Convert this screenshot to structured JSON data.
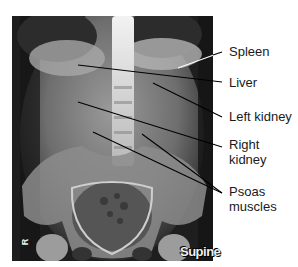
{
  "figure": {
    "type": "labeled abdominal radiograph",
    "view_label": "Supine",
    "side_marker": "R",
    "labels": [
      {
        "id": "spleen",
        "text": "Spleen",
        "x": 229,
        "y": 44,
        "line": [
          [
            178,
            68
          ],
          [
            222,
            52
          ]
        ]
      },
      {
        "id": "liver",
        "text": "Liver",
        "x": 229,
        "y": 75,
        "line": [
          [
            78,
            65
          ],
          [
            222,
            82
          ]
        ]
      },
      {
        "id": "left-kidney",
        "text": "Left kidney",
        "x": 229,
        "y": 109,
        "line": [
          [
            153,
            83
          ],
          [
            222,
            117
          ]
        ]
      },
      {
        "id": "right-kidney",
        "text": "Right\nkidney",
        "line1": "Right",
        "line2": "kidney",
        "x": 229,
        "y": 137,
        "line": [
          [
            78,
            102
          ],
          [
            222,
            147
          ]
        ]
      },
      {
        "id": "psoas",
        "text": "Psoas\nmuscles",
        "line1": "Psoas",
        "line2": "muscles",
        "x": 229,
        "y": 184,
        "lines": [
          [
            [
              93,
              132
            ],
            [
              222,
              193
            ]
          ],
          [
            [
              142,
              134
            ],
            [
              222,
              193
            ]
          ]
        ]
      }
    ],
    "colors": {
      "label_text": "#1a1a1a",
      "leader_line": "#000000",
      "background": "#ffffff"
    }
  }
}
